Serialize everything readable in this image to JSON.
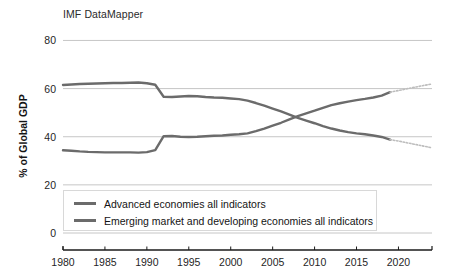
{
  "chart_data": {
    "type": "line",
    "title": "IMF DataMapper",
    "xlabel": "",
    "ylabel": "% of Global GDP",
    "xlim": [
      1980,
      2024
    ],
    "ylim": [
      0,
      86
    ],
    "grid": true,
    "legend_position": "inside-bottom-left",
    "xticks": [
      "1980",
      "1985",
      "1990",
      "1995",
      "2000",
      "2005",
      "2010",
      "2015",
      "2020"
    ],
    "xtick_values": [
      1980,
      1985,
      1990,
      1995,
      2000,
      2005,
      2010,
      2015,
      2020
    ],
    "yticks": [
      "0",
      "20",
      "40",
      "60",
      "80"
    ],
    "ytick_values": [
      0,
      20,
      40,
      60,
      80
    ],
    "line_color": "#6b6b6b",
    "projection_color": "#bdbdbd",
    "grid_color": "#b8b8b8",
    "axis_color": "#1a1a1a",
    "x": [
      1980,
      1981,
      1982,
      1983,
      1984,
      1985,
      1986,
      1987,
      1988,
      1989,
      1990,
      1991,
      1992,
      1993,
      1994,
      1995,
      1996,
      1997,
      1998,
      1999,
      2000,
      2001,
      2002,
      2003,
      2004,
      2005,
      2006,
      2007,
      2008,
      2009,
      2010,
      2011,
      2012,
      2013,
      2014,
      2015,
      2016,
      2017,
      2018,
      2019
    ],
    "projection_x": [
      2019,
      2020,
      2021,
      2022,
      2023,
      2024
    ],
    "series": [
      {
        "name": "Advanced economies all indicators",
        "label": "Advanced economies all indicators",
        "color": "#6b6b6b",
        "values": [
          61.5,
          61.7,
          61.9,
          62.0,
          62.1,
          62.2,
          62.3,
          62.3,
          62.4,
          62.5,
          62.2,
          61.6,
          56.6,
          56.5,
          56.7,
          56.9,
          56.8,
          56.5,
          56.3,
          56.2,
          55.9,
          55.6,
          55.0,
          54.0,
          52.9,
          51.7,
          50.5,
          49.2,
          47.8,
          46.7,
          45.6,
          44.4,
          43.4,
          42.6,
          41.9,
          41.4,
          41.0,
          40.5,
          39.9,
          38.8
        ],
        "projection_values": [
          38.8,
          38.2,
          37.5,
          36.8,
          36.1,
          35.4
        ]
      },
      {
        "name": "Emerging market and developing economies all indicators",
        "label": "Emerging market and developing economies all indicators",
        "color": "#6b6b6b",
        "values": [
          34.4,
          34.2,
          33.9,
          33.7,
          33.6,
          33.5,
          33.5,
          33.5,
          33.5,
          33.4,
          33.6,
          34.4,
          40.2,
          40.3,
          40.0,
          39.9,
          40.0,
          40.2,
          40.4,
          40.5,
          40.8,
          41.0,
          41.4,
          42.3,
          43.4,
          44.6,
          45.8,
          47.2,
          48.6,
          49.7,
          50.8,
          52.0,
          53.1,
          53.9,
          54.6,
          55.2,
          55.7,
          56.3,
          57.1,
          58.5
        ],
        "projection_values": [
          58.5,
          59.2,
          59.9,
          60.6,
          61.3,
          61.9
        ]
      }
    ]
  }
}
